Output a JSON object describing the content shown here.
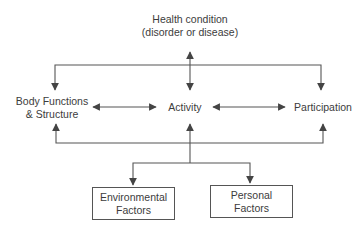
{
  "diagram": {
    "nodes": {
      "health_condition": {
        "line1": "Health condition",
        "line2": "(disorder or disease)"
      },
      "body_functions": {
        "line1": "Body Functions",
        "line2": "& Structure"
      },
      "activity": {
        "label": "Activity"
      },
      "participation": {
        "label": "Participation"
      },
      "environmental": {
        "line1": "Environmental",
        "line2": "Factors"
      },
      "personal": {
        "line1": "Personal",
        "line2": "Factors"
      }
    },
    "edges": [
      {
        "from": "health_condition",
        "to": "activity",
        "type": "bidirectional"
      },
      {
        "from": "health_condition",
        "to": "body_functions",
        "type": "directed"
      },
      {
        "from": "health_condition",
        "to": "participation",
        "type": "directed"
      },
      {
        "from": "body_functions",
        "to": "activity",
        "type": "bidirectional"
      },
      {
        "from": "activity",
        "to": "participation",
        "type": "bidirectional"
      },
      {
        "from": "contextual_bus",
        "to": "body_functions",
        "type": "directed"
      },
      {
        "from": "contextual_bus",
        "to": "activity",
        "type": "directed"
      },
      {
        "from": "contextual_bus",
        "to": "participation",
        "type": "directed"
      },
      {
        "from": "contextual_bus",
        "to": "environmental",
        "type": "directed"
      },
      {
        "from": "contextual_bus",
        "to": "personal",
        "type": "directed"
      }
    ],
    "colors": {
      "line": "#555555",
      "text": "#3c3c3c",
      "background": "#ffffff"
    }
  }
}
